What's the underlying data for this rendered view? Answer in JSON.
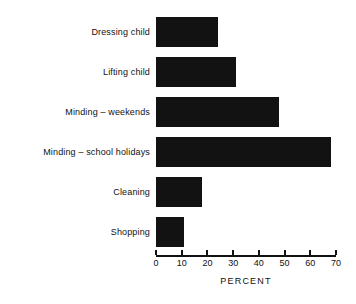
{
  "chart_data": {
    "type": "bar",
    "orientation": "horizontal",
    "title": "",
    "xlabel": "PERCENT",
    "ylabel": "",
    "xlim": [
      0,
      70
    ],
    "grid": false,
    "legend": null,
    "categories": [
      "Dressing child",
      "Lifting child",
      "Minding – weekends",
      "Minding – school holidays",
      "Cleaning",
      "Shopping"
    ],
    "values": [
      24,
      31,
      48,
      68,
      18,
      11
    ],
    "xticks": [
      0,
      10,
      20,
      30,
      40,
      50,
      60,
      70
    ],
    "xtick_labels": [
      "0",
      "10",
      "20",
      "30",
      "40",
      "50",
      "60",
      "70"
    ],
    "bar_color": "#121212",
    "background_color": "#ffffff"
  }
}
